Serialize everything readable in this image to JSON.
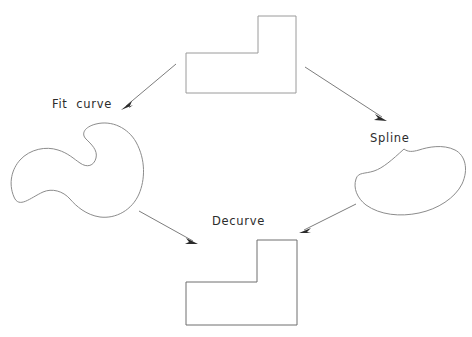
{
  "diagram": {
    "background_color": "#ffffff",
    "width": 472,
    "height": 337,
    "labels": {
      "fit_curve": "Fit  curve",
      "spline": "Spline",
      "decurve": "Decurve"
    },
    "nodes": [
      {
        "id": "top-l-shape",
        "name": "polygonal-l-shape-top",
        "type": "polygon",
        "stroke_color": "#9a9a9a",
        "vertices": [
          [
            186,
            53
          ],
          [
            258,
            53
          ],
          [
            258,
            16
          ],
          [
            296,
            16
          ],
          [
            296,
            93
          ],
          [
            186,
            93
          ]
        ]
      },
      {
        "id": "left-blob",
        "name": "kidney-blob-left",
        "type": "freeform-curve",
        "stroke_color": "#8c8c8c"
      },
      {
        "id": "right-blob",
        "name": "bean-blob-right",
        "type": "freeform-curve",
        "stroke_color": "#8c8c8c"
      },
      {
        "id": "bottom-l-shape",
        "name": "polygonal-l-shape-bottom",
        "type": "polygon",
        "stroke_color": "#6e6e6e",
        "vertices": [
          [
            186,
            282
          ],
          [
            257,
            282
          ],
          [
            257,
            240
          ],
          [
            297,
            240
          ],
          [
            297,
            325
          ],
          [
            186,
            325
          ]
        ]
      }
    ],
    "arrows": [
      {
        "id": "arrow-fit-curve",
        "name": "arrow-top-to-left-blob",
        "from": [
          176,
          64
        ],
        "to": [
          121,
          110
        ],
        "label": "Fit  curve"
      },
      {
        "id": "arrow-spline",
        "name": "arrow-top-to-right-blob",
        "from": [
          305,
          67
        ],
        "to": [
          387,
          121
        ],
        "label": "Spline"
      },
      {
        "id": "arrow-decurve-l",
        "name": "arrow-left-blob-to-bottom",
        "from": [
          139,
          211
        ],
        "to": [
          198,
          244
        ],
        "label": "Decurve"
      },
      {
        "id": "arrow-decurve-r",
        "name": "arrow-right-blob-to-bottom",
        "from": [
          356,
          204
        ],
        "to": [
          299,
          233
        ],
        "label": "Decurve"
      }
    ]
  }
}
